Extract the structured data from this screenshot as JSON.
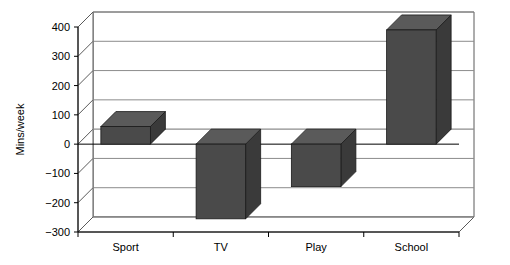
{
  "chart_data": {
    "type": "bar",
    "title": "",
    "subtitle": "",
    "xlabel": "",
    "ylabel": "Mins/week",
    "categories": [
      "Sport",
      "TV",
      "Play",
      "School"
    ],
    "values": [
      60,
      -255,
      -145,
      390
    ],
    "series": [
      {
        "name": "Mins/week",
        "values": [
          60,
          -255,
          -145,
          390
        ]
      }
    ],
    "ylim": [
      -300,
      400
    ],
    "yticks": [
      400,
      300,
      200,
      100,
      0,
      -100,
      -200,
      -300
    ],
    "ytick_labels": [
      "400",
      "300",
      "200",
      "100",
      "0",
      "−100",
      "−200",
      "−300"
    ],
    "grid": true,
    "grid_axis": "y",
    "legend": false,
    "legend_position": "none",
    "three_d": true,
    "bar_color": "#4a4a4a",
    "bar_top_color": "#5a5a5a",
    "bar_side_color": "#3a3a3a",
    "grid_color": "#8c8c8c",
    "axis_color": "#5a5a5a",
    "background": "#ffffff",
    "annotations": []
  },
  "axis": {
    "y_title": "Mins/week"
  }
}
